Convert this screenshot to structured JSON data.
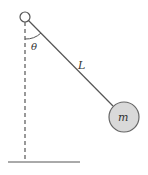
{
  "diagram": {
    "labels": {
      "angle": "θ",
      "length": "L",
      "mass": "m"
    },
    "colors": {
      "line": "#555555",
      "mass_fill": "#d9d9d9",
      "mass_stroke": "#666666",
      "text": "#333333"
    }
  }
}
